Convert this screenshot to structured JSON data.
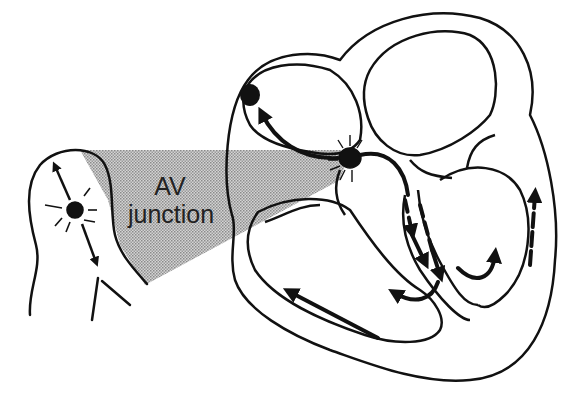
{
  "diagram": {
    "title": "AV junction",
    "label_line1": "AV",
    "label_line2": "junction",
    "colors": {
      "stroke": "#111111",
      "fill": "#ffffff",
      "shade": "#b8b8b8"
    },
    "elements": [
      {
        "name": "sa-node",
        "desc": "filled dot in right atrium"
      },
      {
        "name": "av-node",
        "desc": "starburst node at AV junction"
      },
      {
        "name": "av-junction-inset",
        "desc": "magnified AV junction with node and arrows"
      },
      {
        "name": "bundle-branches",
        "desc": "dashed arrows down septum"
      },
      {
        "name": "purkinje-arrows",
        "desc": "arrows along ventricular walls"
      }
    ]
  }
}
